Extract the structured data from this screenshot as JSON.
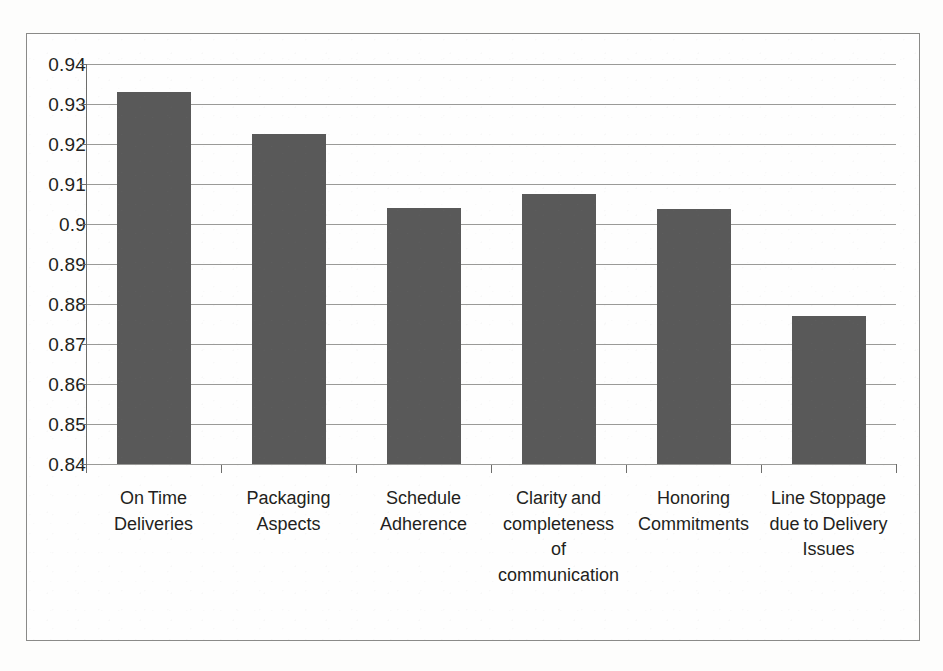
{
  "chart_data": {
    "type": "bar",
    "title": "",
    "xlabel": "",
    "ylabel": "",
    "categories": [
      "On Time Deliveries",
      "Packaging Aspects",
      "Schedule Adherence",
      "Clarity and completeness of communication",
      "Honoring Commitments",
      "Line Stoppage due to Delivery Issues"
    ],
    "values": [
      0.933,
      0.9225,
      0.904,
      0.9075,
      0.9038,
      0.877
    ],
    "ylim": [
      0.84,
      0.94
    ],
    "ytick_values": [
      0.94,
      0.93,
      0.92,
      0.91,
      0.9,
      0.89,
      0.88,
      0.87,
      0.86,
      0.85,
      0.84
    ],
    "ytick_labels": [
      "0.94",
      "0.93",
      "0.92",
      "0.91",
      "0.9",
      "0.89",
      "0.88",
      "0.87",
      "0.86",
      "0.85",
      "0.84"
    ],
    "grid": "horizontal",
    "legend": "none",
    "bar_color": "#595959",
    "gridline_color": "#9a9a98",
    "axis_color": "#6d6d6b",
    "background_color": "#fefefe",
    "border_color": "#8a8a88"
  },
  "category_label_lines": [
    [
      "On Time",
      "Deliveries"
    ],
    [
      "Packaging",
      "Aspects"
    ],
    [
      "Schedule",
      "Adherence"
    ],
    [
      "Clarity and",
      "completeness",
      "of",
      "communication"
    ],
    [
      "Honoring",
      "Commitments"
    ],
    [
      "Line Stoppage",
      "due to Delivery",
      "Issues"
    ]
  ]
}
